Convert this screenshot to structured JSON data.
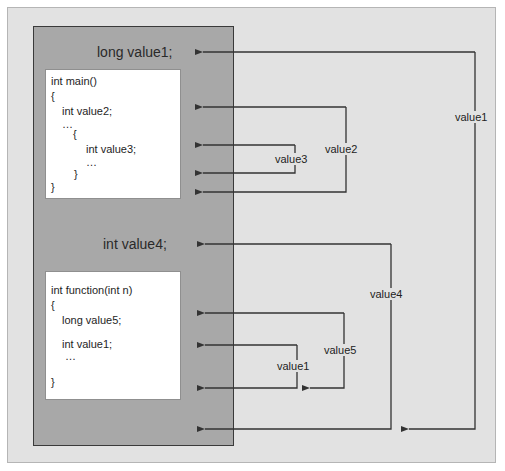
{
  "diagram": {
    "global_declarations": {
      "top": "long value1;",
      "middle": "int value4;"
    },
    "main_block": {
      "lines": [
        "int main()",
        "{",
        "int value2;",
        "…",
        "{",
        "int value3;",
        "…",
        "}",
        "}"
      ]
    },
    "function_block": {
      "lines": [
        "int function(int n)",
        "{",
        "long value5;",
        "int value1;",
        "…",
        "}"
      ]
    },
    "scope_labels": {
      "value1_global": "value1",
      "value2": "value2",
      "value3": "value3",
      "value4": "value4",
      "value5": "value5",
      "value1_local": "value1"
    },
    "colors": {
      "background": "#e2e2e2",
      "scope_box": "#a8a8a8",
      "code_box": "#ffffff",
      "line": "#333333"
    }
  }
}
